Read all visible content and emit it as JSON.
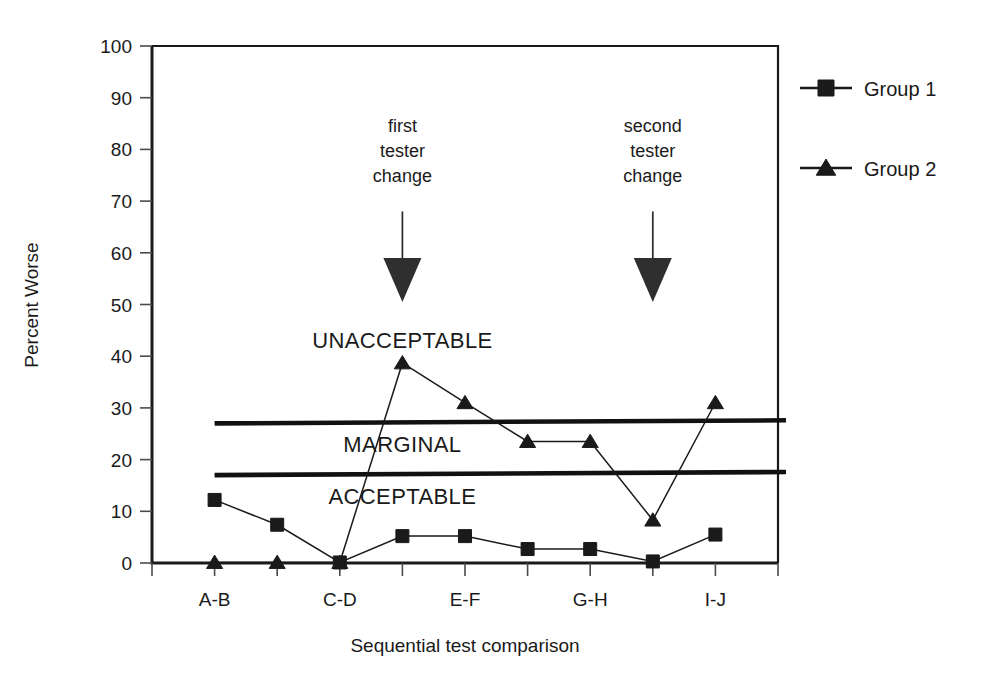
{
  "chart_data": {
    "type": "line",
    "title": "",
    "xlabel": "Sequential test comparison",
    "ylabel": "Percent Worse",
    "ylim": [
      0,
      100
    ],
    "yticks": [
      0,
      10,
      20,
      30,
      40,
      50,
      60,
      70,
      80,
      90,
      100
    ],
    "ytick_labels": [
      "0",
      "10",
      "20",
      "30",
      "40",
      "50",
      "60",
      "70",
      "80",
      "90",
      "100"
    ],
    "xlim": [
      0,
      10
    ],
    "xtick_positions": [
      0,
      1,
      2,
      3,
      4,
      5,
      6,
      7,
      8,
      9,
      10
    ],
    "categories": [
      "A-B",
      "C-D",
      "E-F",
      "G-H",
      "I-J"
    ],
    "category_positions": [
      1.0,
      3.0,
      5.0,
      7.0,
      9.0
    ],
    "grid": false,
    "legend_position": "right",
    "series": [
      {
        "name": "Group 1",
        "marker": "square",
        "x": [
          1,
          2,
          3,
          4,
          5,
          6,
          7,
          8,
          9
        ],
        "values": [
          12.2,
          7.4,
          0.1,
          5.2,
          5.2,
          2.7,
          2.7,
          0.3,
          5.5
        ]
      },
      {
        "name": "Group 2",
        "marker": "triangle",
        "x": [
          1,
          2,
          3,
          4,
          5,
          6,
          7,
          8,
          9
        ],
        "values": [
          0.1,
          0.1,
          0.1,
          38.7,
          31.0,
          23.5,
          23.5,
          8.3,
          31.0
        ]
      }
    ],
    "threshold_lines": [
      {
        "label": "upper",
        "y_left": 27.0,
        "y_right": 27.6
      },
      {
        "label": "lower",
        "y_left": 17.0,
        "y_right": 17.6
      }
    ],
    "zone_labels": [
      {
        "text": "UNACCEPTABLE",
        "x": 4.0,
        "y": 41.5
      },
      {
        "text": "MARGINAL",
        "x": 4.0,
        "y": 21.5
      },
      {
        "text": "ACCEPTABLE",
        "x": 4.0,
        "y": 11.5
      }
    ],
    "annotations": [
      {
        "lines": [
          "first",
          "tester",
          "change"
        ],
        "x": 4.0,
        "text_top_y": 83.0,
        "arrow_top_y": 68.0,
        "arrow_tip_y": 50.5
      },
      {
        "lines": [
          "second",
          "tester",
          "change"
        ],
        "x": 8.0,
        "text_top_y": 83.0,
        "arrow_top_y": 68.0,
        "arrow_tip_y": 50.5
      }
    ]
  },
  "legend": {
    "entries": [
      {
        "label": "Group 1",
        "marker": "square-marker-icon"
      },
      {
        "label": "Group 2",
        "marker": "triangle-marker-icon"
      }
    ]
  },
  "colors": {
    "ink": "#1a1a1a",
    "background": "#ffffff",
    "threshold": "#111111",
    "arrow": "#2f2f2f"
  }
}
